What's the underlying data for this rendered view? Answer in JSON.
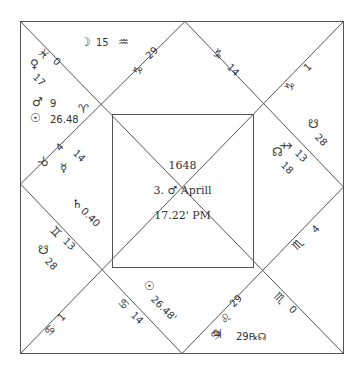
{
  "chart_title": "Square horoscope chart",
  "center": {
    "year": "1648",
    "date": "3. ♂ Aprill",
    "time": "17.22' PM"
  },
  "house_cusps": [
    {
      "sign": "♓",
      "degree": "0",
      "position": "top-left-diagonal"
    },
    {
      "sign": "♑",
      "degree": "29",
      "position": "top-left-upper-diagonal"
    },
    {
      "sign": "♑",
      "degree": "14",
      "position": "top-right-upper-diagonal"
    },
    {
      "sign": "♑",
      "degree": "1",
      "position": "top-right-diagonal"
    },
    {
      "sign": "♐",
      "degree": "13",
      "position": "right-upper-diagonal"
    },
    {
      "sign": "♏",
      "degree": "4",
      "position": "right-lower-diagonal"
    },
    {
      "sign": "♏",
      "degree": "0",
      "position": "bottom-right-diagonal"
    },
    {
      "sign": "♌",
      "degree": "29",
      "position": "bottom-left-inner-diagonal"
    },
    {
      "sign": "♋",
      "degree": "14",
      "position": "bottom-right-inner-diagonal"
    },
    {
      "sign": "♋",
      "degree": "1",
      "position": "bottom-left-diagonal"
    },
    {
      "sign": "♊",
      "degree": "13",
      "position": "left-lower-diagonal"
    },
    {
      "sign": "♉",
      "degree": "4",
      "position": "left-upper-diagonal"
    },
    {
      "sign": "♈",
      "degree": "",
      "position": "left-upper-inner"
    }
  ],
  "planets": [
    {
      "glyph": "☽",
      "value": "15",
      "sign": "♒"
    },
    {
      "glyph": "♀",
      "value": "17"
    },
    {
      "glyph": "♂",
      "value": "9"
    },
    {
      "glyph": "☉",
      "value": "26.48"
    },
    {
      "glyph": "☿",
      "value": "14"
    },
    {
      "glyph": "♄",
      "value": "0.40"
    },
    {
      "glyph": "☋",
      "value": "28",
      "house": "left"
    },
    {
      "glyph": "☋",
      "value": "28",
      "house": "right"
    },
    {
      "glyph": "☊",
      "value": "18"
    },
    {
      "glyph": "☉",
      "value": "26.48'",
      "house": "bottom"
    },
    {
      "glyph": "♃",
      "value": "29℞☊"
    }
  ],
  "colors": {
    "line": "#555555",
    "text": "#333333",
    "background": "#ffffff"
  }
}
